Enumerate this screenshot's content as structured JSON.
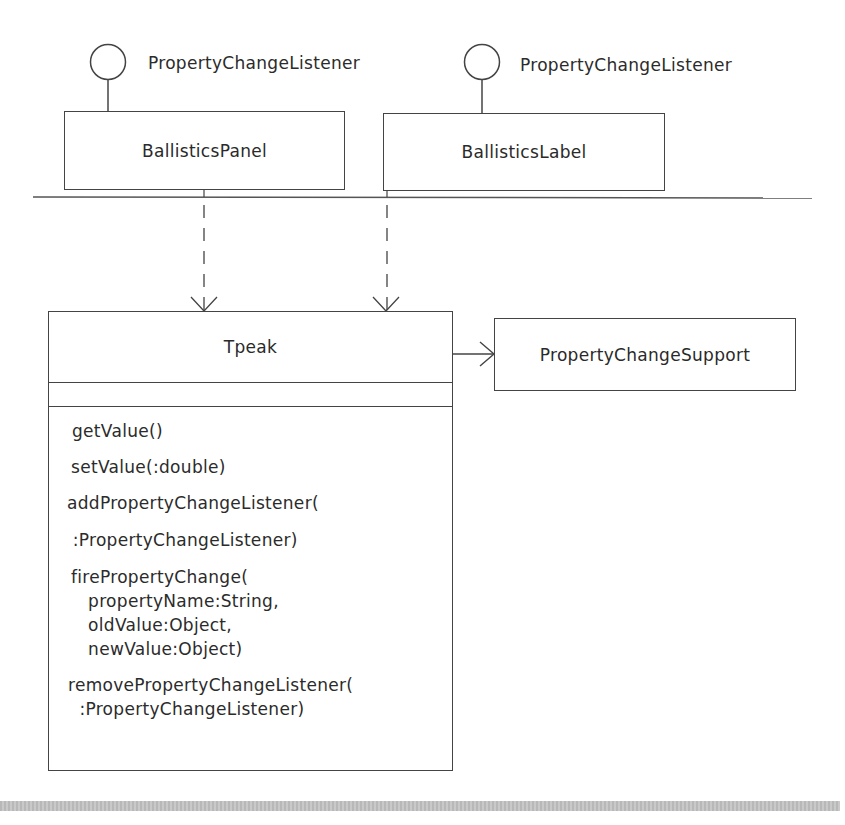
{
  "diagram": {
    "type": "UML class diagram",
    "interfaces": [
      {
        "id": "pcl-left",
        "label": "PropertyChangeListener"
      },
      {
        "id": "pcl-right",
        "label": "PropertyChangeListener"
      }
    ],
    "classes": {
      "ballistics_panel": {
        "name": "BallisticsPanel"
      },
      "ballistics_label": {
        "name": "BallisticsLabel"
      },
      "tpeak": {
        "name": "Tpeak",
        "attributes": [],
        "operations": [
          {
            "lines": [
              "getValue()"
            ]
          },
          {
            "lines": [
              "setValue(:double)"
            ]
          },
          {
            "lines": [
              "addPropertyChangeListener(",
              " :PropertyChangeListener)"
            ]
          },
          {
            "lines": [
              "firePropertyChange(",
              "   propertyName:String,",
              "   oldValue:Object,",
              "   newValue:Object)"
            ]
          },
          {
            "lines": [
              "removePropertyChangeListener(",
              "  :PropertyChangeListener)"
            ]
          }
        ]
      },
      "property_change_support": {
        "name": "PropertyChangeSupport"
      }
    },
    "relationships": [
      {
        "from": "BallisticsPanel",
        "to": "Tpeak",
        "kind": "dependency (dashed arrow)"
      },
      {
        "from": "BallisticsLabel",
        "to": "Tpeak",
        "kind": "dependency (dashed arrow)"
      },
      {
        "from": "Tpeak",
        "to": "PropertyChangeSupport",
        "kind": "association (navigable arrow)"
      }
    ],
    "colors": {
      "line": "#444444",
      "text": "#2b2b2b",
      "footer_bar": "#c0c0c0"
    }
  }
}
